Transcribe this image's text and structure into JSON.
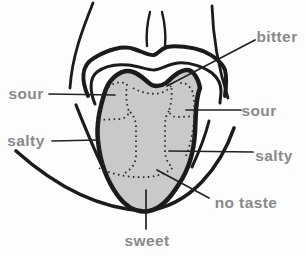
{
  "diagram": {
    "labels": {
      "bitter": "bitter",
      "sour_left": "sour",
      "sour_right": "sour",
      "salty_left": "salty",
      "salty_right": "salty",
      "no_taste": "no taste",
      "sweet": "sweet"
    },
    "colors": {
      "tongue_fill": "#c9c9c9",
      "outline": "#1b1b1b",
      "label_text": "#8a8a8a",
      "background": "#fdfdfd"
    }
  }
}
